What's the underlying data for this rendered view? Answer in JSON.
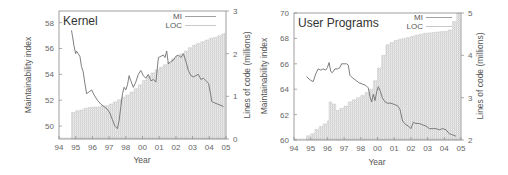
{
  "chart_data": [
    {
      "type": "line+bar",
      "title": "Kernel",
      "xlabel": "Year",
      "ylabel": "Maintainability index",
      "y2label": "Lines of code (millions)",
      "x_tick_labels": [
        "94",
        "95",
        "96",
        "97",
        "98",
        "00",
        "01",
        "02",
        "03",
        "04",
        "05"
      ],
      "yticks": [
        50,
        52,
        54,
        56,
        58
      ],
      "ylim": [
        49,
        58.9
      ],
      "y2ticks": [
        0,
        1,
        2,
        3
      ],
      "y2lim": [
        0,
        3
      ],
      "legend": [
        "MI",
        "LOC"
      ],
      "legend_position": "top-right",
      "grid": false,
      "series": [
        {
          "name": "MI",
          "type": "line",
          "axis": "left",
          "points": [
            [
              0.75,
              57.4
            ],
            [
              0.8,
              57.0
            ],
            [
              0.9,
              56.2
            ],
            [
              1.0,
              55.6
            ],
            [
              1.05,
              55.8
            ],
            [
              1.15,
              55.6
            ],
            [
              1.25,
              55.4
            ],
            [
              1.35,
              54.6
            ],
            [
              1.45,
              54.2
            ],
            [
              1.55,
              53.3
            ],
            [
              1.65,
              52.5
            ],
            [
              1.75,
              52.6
            ],
            [
              1.95,
              52.8
            ],
            [
              2.1,
              52.4
            ],
            [
              2.3,
              52.0
            ],
            [
              2.5,
              51.7
            ],
            [
              2.7,
              51.5
            ],
            [
              2.9,
              51.3
            ],
            [
              3.05,
              51.0
            ],
            [
              3.2,
              50.5
            ],
            [
              3.35,
              50.0
            ],
            [
              3.5,
              49.8
            ],
            [
              3.6,
              50.4
            ],
            [
              3.7,
              51.5
            ],
            [
              3.8,
              52.5
            ],
            [
              3.9,
              53.0
            ],
            [
              4.0,
              52.8
            ],
            [
              4.1,
              53.2
            ],
            [
              4.2,
              53.9
            ],
            [
              4.3,
              53.5
            ],
            [
              4.45,
              53.0
            ],
            [
              4.6,
              53.4
            ],
            [
              4.75,
              54.0
            ],
            [
              4.9,
              54.3
            ],
            [
              5.05,
              53.9
            ],
            [
              5.2,
              53.7
            ],
            [
              5.35,
              54.0
            ],
            [
              5.5,
              53.5
            ],
            [
              5.65,
              53.6
            ],
            [
              5.8,
              53.4
            ],
            [
              5.95,
              55.3
            ],
            [
              6.1,
              55.4
            ],
            [
              6.25,
              55.5
            ],
            [
              6.35,
              55.3
            ],
            [
              6.45,
              55.8
            ],
            [
              6.55,
              54.8
            ],
            [
              6.7,
              55.0
            ],
            [
              6.85,
              55.1
            ],
            [
              7.0,
              55.4
            ],
            [
              7.15,
              55.5
            ],
            [
              7.3,
              55.3
            ],
            [
              7.45,
              55.6
            ],
            [
              7.6,
              55.0
            ],
            [
              7.75,
              54.3
            ],
            [
              7.9,
              53.9
            ],
            [
              8.05,
              53.8
            ],
            [
              8.2,
              53.9
            ],
            [
              8.35,
              54.0
            ],
            [
              8.5,
              53.6
            ],
            [
              8.65,
              53.7
            ],
            [
              8.8,
              53.5
            ],
            [
              8.95,
              53.3
            ],
            [
              9.05,
              52.7
            ],
            [
              9.15,
              51.9
            ],
            [
              9.3,
              51.8
            ],
            [
              9.5,
              51.7
            ],
            [
              9.7,
              51.6
            ],
            [
              9.85,
              51.5
            ]
          ]
        },
        {
          "name": "LOC",
          "type": "bar",
          "axis": "right",
          "points": [
            [
              0.75,
              0.62
            ],
            [
              1.0,
              0.66
            ],
            [
              1.25,
              0.68
            ],
            [
              1.5,
              0.72
            ],
            [
              1.75,
              0.74
            ],
            [
              2.0,
              0.75
            ],
            [
              2.5,
              0.78
            ],
            [
              3.0,
              0.82
            ],
            [
              3.25,
              0.87
            ],
            [
              3.5,
              0.92
            ],
            [
              3.75,
              0.98
            ],
            [
              4.0,
              1.03
            ],
            [
              4.25,
              1.1
            ],
            [
              4.5,
              1.18
            ],
            [
              4.75,
              1.27
            ],
            [
              5.0,
              1.37
            ],
            [
              5.25,
              1.47
            ],
            [
              5.5,
              1.55
            ],
            [
              5.75,
              1.62
            ],
            [
              6.0,
              1.68
            ],
            [
              6.25,
              1.74
            ],
            [
              6.5,
              1.8
            ],
            [
              6.75,
              1.88
            ],
            [
              7.0,
              1.94
            ],
            [
              7.25,
              2.0
            ],
            [
              7.5,
              2.06
            ],
            [
              7.75,
              2.14
            ],
            [
              8.0,
              2.2
            ],
            [
              8.25,
              2.24
            ],
            [
              8.5,
              2.28
            ],
            [
              8.75,
              2.32
            ],
            [
              9.0,
              2.36
            ],
            [
              9.25,
              2.38
            ],
            [
              9.5,
              2.42
            ],
            [
              9.75,
              2.46
            ],
            [
              9.9,
              2.48
            ]
          ]
        }
      ]
    },
    {
      "type": "line+bar",
      "title": "User Programs",
      "xlabel": "Year",
      "ylabel": "Maintainability index",
      "y2label": "Lines of code (millions)",
      "x_tick_labels": [
        "94",
        "95",
        "96",
        "97",
        "98",
        "00",
        "01",
        "02",
        "03",
        "04",
        "05"
      ],
      "yticks": [
        60,
        62,
        64,
        66,
        68,
        70
      ],
      "ylim": [
        60,
        70
      ],
      "y2ticks": [
        2,
        3,
        4,
        5
      ],
      "y2lim": [
        2,
        5
      ],
      "legend": [
        "MI",
        "LOC"
      ],
      "legend_position": "top-right",
      "grid": false,
      "series": [
        {
          "name": "MI",
          "type": "line",
          "axis": "left",
          "points": [
            [
              0.75,
              65.0
            ],
            [
              0.9,
              64.8
            ],
            [
              1.0,
              64.7
            ],
            [
              1.15,
              64.6
            ],
            [
              1.3,
              65.2
            ],
            [
              1.45,
              65.6
            ],
            [
              1.6,
              65.5
            ],
            [
              1.75,
              65.6
            ],
            [
              1.9,
              65.5
            ],
            [
              2.0,
              65.7
            ],
            [
              2.1,
              66.1
            ],
            [
              2.2,
              65.4
            ],
            [
              2.3,
              65.3
            ],
            [
              2.45,
              65.6
            ],
            [
              2.6,
              65.6
            ],
            [
              2.75,
              65.7
            ],
            [
              2.85,
              66.0
            ],
            [
              3.0,
              66.0
            ],
            [
              3.15,
              66.0
            ],
            [
              3.25,
              65.9
            ],
            [
              3.35,
              65.1
            ],
            [
              3.5,
              64.9
            ],
            [
              3.7,
              64.7
            ],
            [
              3.9,
              64.5
            ],
            [
              4.1,
              64.4
            ],
            [
              4.3,
              64.3
            ],
            [
              4.45,
              64.1
            ],
            [
              4.55,
              63.4
            ],
            [
              4.65,
              63.0
            ],
            [
              4.75,
              63.6
            ],
            [
              4.85,
              63.1
            ],
            [
              4.95,
              63.8
            ],
            [
              5.05,
              64.2
            ],
            [
              5.15,
              63.9
            ],
            [
              5.3,
              63.3
            ],
            [
              5.45,
              63.0
            ],
            [
              5.6,
              62.9
            ],
            [
              5.8,
              62.9
            ],
            [
              6.0,
              62.8
            ],
            [
              6.2,
              62.7
            ],
            [
              6.35,
              62.4
            ],
            [
              6.5,
              61.5
            ],
            [
              6.7,
              61.2
            ],
            [
              6.85,
              61.1
            ],
            [
              7.0,
              60.9
            ],
            [
              7.15,
              61.4
            ],
            [
              7.3,
              61.3
            ],
            [
              7.5,
              61.3
            ],
            [
              7.7,
              61.2
            ],
            [
              7.9,
              61.1
            ],
            [
              8.1,
              60.9
            ],
            [
              8.3,
              60.9
            ],
            [
              8.5,
              60.9
            ],
            [
              8.7,
              60.8
            ],
            [
              8.9,
              60.9
            ],
            [
              9.1,
              60.8
            ],
            [
              9.3,
              60.5
            ],
            [
              9.5,
              60.4
            ],
            [
              9.7,
              60.3
            ]
          ]
        },
        {
          "name": "LOC",
          "type": "bar",
          "axis": "right",
          "points": [
            [
              0.75,
              2.1
            ],
            [
              1.0,
              2.15
            ],
            [
              1.25,
              2.25
            ],
            [
              1.5,
              2.32
            ],
            [
              1.75,
              2.38
            ],
            [
              2.0,
              2.45
            ],
            [
              2.1,
              2.9
            ],
            [
              2.25,
              2.85
            ],
            [
              2.4,
              2.85
            ],
            [
              2.5,
              2.7
            ],
            [
              2.75,
              2.75
            ],
            [
              3.0,
              2.8
            ],
            [
              3.25,
              2.9
            ],
            [
              3.5,
              2.95
            ],
            [
              3.75,
              3.0
            ],
            [
              4.0,
              3.05
            ],
            [
              4.25,
              3.12
            ],
            [
              4.5,
              3.2
            ],
            [
              4.75,
              3.4
            ],
            [
              5.0,
              3.7
            ],
            [
              5.25,
              4.0
            ],
            [
              5.5,
              4.25
            ],
            [
              5.75,
              4.3
            ],
            [
              6.0,
              4.35
            ],
            [
              6.25,
              4.38
            ],
            [
              6.5,
              4.4
            ],
            [
              6.75,
              4.42
            ],
            [
              7.0,
              4.45
            ],
            [
              7.25,
              4.48
            ],
            [
              7.5,
              4.5
            ],
            [
              7.75,
              4.52
            ],
            [
              8.0,
              4.53
            ],
            [
              8.25,
              4.54
            ],
            [
              8.5,
              4.55
            ],
            [
              8.75,
              4.56
            ],
            [
              9.0,
              4.57
            ],
            [
              9.25,
              4.6
            ],
            [
              9.5,
              4.8
            ],
            [
              9.75,
              5.0
            ]
          ]
        }
      ]
    }
  ],
  "charts": {
    "left": {
      "title": "Kernel",
      "xlabel": "Year",
      "ylabel": "Maintainability index",
      "y2label": "Lines of code (millions)",
      "legend_mi": "MI",
      "legend_loc": "LOC"
    },
    "right": {
      "title": "User Programs",
      "xlabel": "Year",
      "ylabel": "Maintainability index",
      "y2label": "Lines of code (millions)",
      "legend_mi": "MI",
      "legend_loc": "LOC"
    }
  },
  "colors": {
    "mi_line": "#666666",
    "loc_fill": "#d9d9d9",
    "axis": "#777777",
    "text": "#555555"
  }
}
